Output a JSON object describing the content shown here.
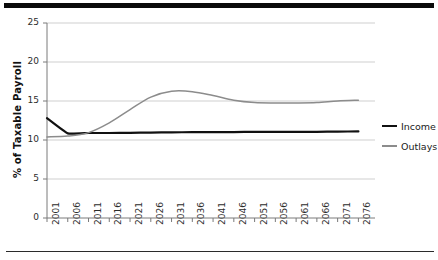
{
  "chart_data": {
    "type": "line",
    "title": "",
    "xlabel": "",
    "ylabel": "% of Taxable Payroll",
    "xlim": [
      2001,
      2080
    ],
    "ylim": [
      0,
      25
    ],
    "yticks": [
      0,
      5,
      10,
      15,
      20,
      25
    ],
    "ytick_labels": [
      "0",
      "5",
      "10",
      "15",
      "20",
      "25"
    ],
    "xticks": [
      2001,
      2006,
      2011,
      2016,
      2021,
      2026,
      2031,
      2036,
      2041,
      2046,
      2051,
      2056,
      2061,
      2066,
      2071,
      2076
    ],
    "xtick_labels": [
      "2001",
      "2006",
      "2011",
      "2016",
      "2021",
      "2026",
      "2031",
      "2036",
      "2041",
      "2046",
      "2051",
      "2056",
      "2061",
      "2066",
      "2071",
      "2076"
    ],
    "grid": true,
    "grid_axis": "y",
    "legend_position": "right",
    "x": [
      2001,
      2006,
      2011,
      2016,
      2021,
      2026,
      2031,
      2036,
      2041,
      2046,
      2051,
      2056,
      2061,
      2066,
      2071,
      2076
    ],
    "series": [
      {
        "name": "Income",
        "color": "#111111",
        "values": [
          12.8,
          10.85,
          10.9,
          10.9,
          10.92,
          10.95,
          10.98,
          11.0,
          11.0,
          11.02,
          11.05,
          11.05,
          11.05,
          11.05,
          11.08,
          11.1
        ]
      },
      {
        "name": "Outlays",
        "color": "#8c8c8c",
        "values": [
          10.4,
          10.5,
          10.95,
          12.2,
          13.9,
          15.5,
          16.25,
          16.2,
          15.7,
          15.1,
          14.8,
          14.75,
          14.75,
          14.8,
          15.0,
          15.1
        ]
      }
    ],
    "annotations": []
  },
  "legend": {
    "items": [
      {
        "label": "Income",
        "color": "#111111"
      },
      {
        "label": "Outlays",
        "color": "#8c8c8c"
      }
    ]
  },
  "axis": {
    "y_title": "% of Taxable Payroll"
  },
  "colors": {
    "income": "#111111",
    "outlays": "#8c8c8c",
    "grid": "#c9c9c9",
    "axis": "#7a7a7a",
    "rule": "#0a0a0a"
  }
}
